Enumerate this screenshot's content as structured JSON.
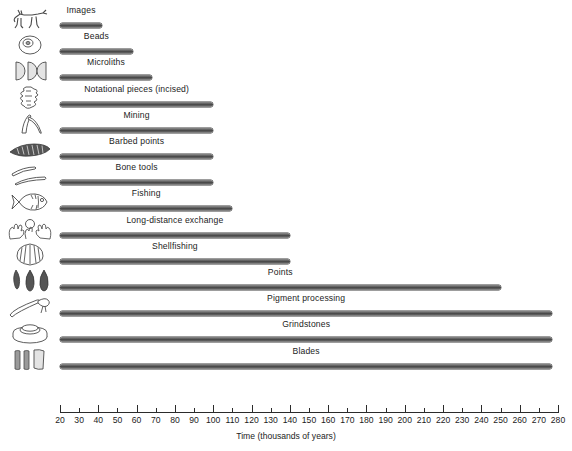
{
  "chart_data": {
    "type": "bar",
    "orientation": "horizontal",
    "title": "",
    "xlabel": "Time (thousands of years)",
    "ylabel": "",
    "xlim": [
      20,
      280
    ],
    "xticks": [
      20,
      30,
      40,
      50,
      60,
      70,
      80,
      90,
      100,
      110,
      120,
      130,
      140,
      150,
      160,
      170,
      180,
      190,
      200,
      210,
      220,
      230,
      240,
      250,
      260,
      270,
      280
    ],
    "xticklabels": [
      "20",
      "30",
      "40",
      "50",
      "60",
      "70",
      "80",
      "90",
      "100",
      "110",
      "120",
      "130",
      "140",
      "150",
      "160",
      "170",
      "180",
      "190",
      "200",
      "210",
      "220",
      "230",
      "240",
      "250",
      "260",
      "270",
      "280"
    ],
    "grid": false,
    "legend": null,
    "bar_start": 20,
    "categories": [
      "Images",
      "Beads",
      "Microliths",
      "Notational pieces (incised)",
      "Mining",
      "Barbed points",
      "Bone tools",
      "Fishing",
      "Long-distance exchange",
      "Shellfishing",
      "Points",
      "Pigment processing",
      "Grindstones",
      "Blades"
    ],
    "values": [
      42,
      58,
      68,
      100,
      100,
      100,
      100,
      110,
      140,
      140,
      250,
      277,
      277,
      277
    ],
    "icons": [
      "animal-figure-icon",
      "bead-disc-icon",
      "microlith-crescents-icon",
      "notational-piece-icon",
      "mining-pick-icon",
      "barbed-point-icon",
      "bone-tools-icon",
      "fish-icon",
      "exchange-hands-icon",
      "shell-icon",
      "stone-points-icon",
      "pigment-applicator-icon",
      "grindstone-icon",
      "blades-icon"
    ]
  },
  "colors": {
    "bar_dark": "#4a4a4a",
    "bar_light": "#9a9a9a",
    "axis": "#2b2b2b",
    "text": "#1c1c1c",
    "background": "#ffffff"
  }
}
